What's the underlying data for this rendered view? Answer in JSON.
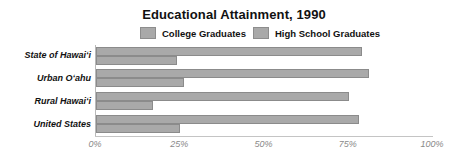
{
  "chart_data": {
    "type": "bar",
    "orientation": "horizontal",
    "title": "Educational Attainment, 1990",
    "xlabel": "",
    "ylabel": "",
    "xlim": [
      0,
      100
    ],
    "xticks": [
      0,
      25,
      50,
      75,
      100
    ],
    "xtick_labels": [
      "0%",
      "25%",
      "50%",
      "75%",
      "100%"
    ],
    "grid": false,
    "legend_position": "top-center",
    "categories": [
      "State of Hawaiʻi",
      "Urban Oʻahu",
      "Rural Hawaiʻi",
      "United States"
    ],
    "series": [
      {
        "name": "High School Graduates",
        "color": "#a9a9a9",
        "values": [
          79,
          81,
          75,
          78
        ]
      },
      {
        "name": "College Graduates",
        "color": "#a9a9a9",
        "values": [
          24,
          26,
          17,
          25
        ]
      }
    ]
  },
  "legend": {
    "items": [
      {
        "label": "College Graduates"
      },
      {
        "label": "High School Graduates"
      }
    ]
  },
  "colors": {
    "bar_fill": "#a9a9a9",
    "bar_stroke": "#8b8b8b",
    "axis": "#b9b9b9",
    "tick_text": "#8a8a8a",
    "text": "#111111"
  }
}
